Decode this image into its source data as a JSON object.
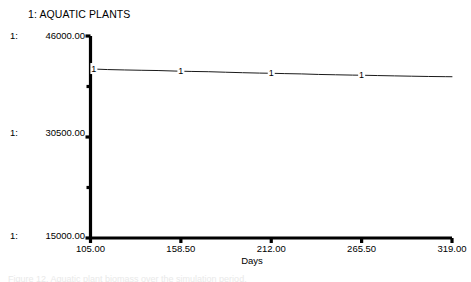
{
  "chart_data": {
    "type": "line",
    "title": "1: AQUATIC PLANTS",
    "xlabel": "Days",
    "ylabel": "",
    "xlim": [
      105.0,
      319.0
    ],
    "ylim": [
      15000.0,
      46000.0
    ],
    "grid": false,
    "legend_position": "top-left",
    "xticks": [
      "105.00",
      "158.50",
      "212.00",
      "265.50",
      "319.00"
    ],
    "xtick_values": [
      105.0,
      158.5,
      212.0,
      265.5,
      319.0
    ],
    "yticks": [
      "46000.00",
      "30500.00",
      "15000.00"
    ],
    "ytick_values": [
      46000.0,
      30500.0,
      15000.0
    ],
    "y_minor_tick_values": [
      38250.0,
      22750.0
    ],
    "scale_index_labels": [
      "1:",
      "1:",
      "1:"
    ],
    "series": [
      {
        "name": "1",
        "marker_label": "1",
        "color": "#1a1a1a",
        "x": [
          105.0,
          115.0,
          125.0,
          135.0,
          145.0,
          155.0,
          158.5,
          165.0,
          175.0,
          185.0,
          195.0,
          205.0,
          212.0,
          220.0,
          230.0,
          240.0,
          250.0,
          260.0,
          265.5,
          275.0,
          285.0,
          295.0,
          305.0,
          315.0,
          319.0
        ],
        "values": [
          40950,
          40850,
          40790,
          40740,
          40700,
          40620,
          40600,
          40560,
          40520,
          40440,
          40370,
          40310,
          40280,
          40230,
          40180,
          40100,
          40050,
          40000,
          39980,
          39930,
          39880,
          39830,
          39790,
          39760,
          39750
        ],
        "marker_x": [
          107.0,
          158.5,
          212.0,
          265.5
        ]
      }
    ]
  },
  "chart": {
    "title": "1: AQUATIC PLANTS",
    "xaxis_title": "Days"
  },
  "caption": {
    "text": "Figure 12. Aquatic plant biomass over the simulation period."
  }
}
